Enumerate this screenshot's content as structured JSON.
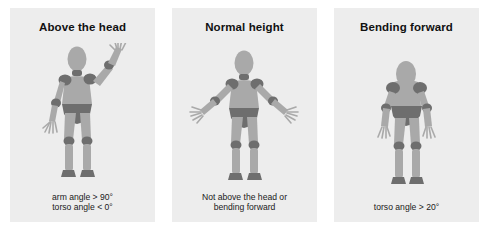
{
  "figure": {
    "background_color": "#ffffff",
    "panel_background_color": "#ededed",
    "body_color": "#a9a9a9",
    "joint_color": "#6e6e6e",
    "title_color": "#111111",
    "caption_color": "#1a1a1a"
  },
  "panels": [
    {
      "id": "above-the-head",
      "title": "Above the head",
      "caption": "arm angle > 90°\ntorso angle < 0°",
      "pose": "right arm raised above head, left arm hanging down, standing upright"
    },
    {
      "id": "normal-height",
      "title": "Normal height",
      "caption": "Not above the head or\nbending forward",
      "pose": "both arms extended outward and slightly downward, standing upright"
    },
    {
      "id": "bending-forward",
      "title": "Bending forward",
      "caption": "torso angle > 20°",
      "pose": "both arms hanging at sides, torso leaning forward"
    }
  ]
}
